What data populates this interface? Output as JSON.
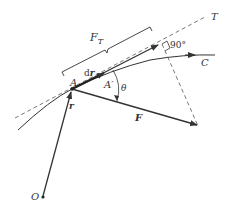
{
  "diagram": {
    "labels": {
      "point_A": "A",
      "point_A_prime": "A′",
      "origin": "O",
      "curve": "C",
      "tangent": "T",
      "force": "F",
      "position_vector": "r",
      "displacement": "dr",
      "displacement_d": "d",
      "displacement_r": "r",
      "tangential_component": "F",
      "tangential_subscript": "T",
      "angle": "θ",
      "right_angle": "90°"
    },
    "colors": {
      "stroke": "#333333",
      "dashed": "#555555"
    }
  }
}
